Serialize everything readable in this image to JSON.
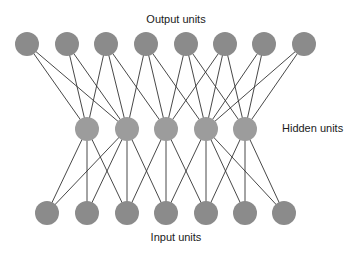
{
  "labels": {
    "output": "Output units",
    "hidden": "Hidden units",
    "input": "Input units"
  },
  "colors": {
    "background": "#ffffff",
    "edge": "#333333",
    "output_node": "#8b8b8b",
    "hidden_node": "#9c9c9c",
    "input_node": "#8b8b8b",
    "text": "#1a1a1a"
  },
  "node_radius": 12,
  "layers": {
    "output": {
      "y": 44,
      "x": [
        27,
        67,
        106,
        146,
        186,
        225,
        264,
        304
      ]
    },
    "hidden": {
      "y": 129,
      "x": [
        87,
        127,
        166,
        206,
        245
      ]
    },
    "input": {
      "y": 213,
      "x": [
        47,
        87,
        127,
        166,
        206,
        245,
        284
      ]
    }
  },
  "edges": {
    "output_to_hidden": [
      [
        0,
        0
      ],
      [
        0,
        1
      ],
      [
        1,
        0
      ],
      [
        1,
        1
      ],
      [
        2,
        0
      ],
      [
        2,
        1
      ],
      [
        2,
        2
      ],
      [
        3,
        1
      ],
      [
        3,
        2
      ],
      [
        3,
        3
      ],
      [
        4,
        2
      ],
      [
        4,
        3
      ],
      [
        4,
        4
      ],
      [
        5,
        2
      ],
      [
        5,
        3
      ],
      [
        5,
        4
      ],
      [
        6,
        3
      ],
      [
        6,
        4
      ],
      [
        7,
        3
      ],
      [
        7,
        4
      ]
    ],
    "hidden_to_input": [
      [
        0,
        0
      ],
      [
        0,
        1
      ],
      [
        0,
        2
      ],
      [
        1,
        0
      ],
      [
        1,
        1
      ],
      [
        1,
        2
      ],
      [
        1,
        3
      ],
      [
        2,
        2
      ],
      [
        2,
        3
      ],
      [
        2,
        4
      ],
      [
        3,
        3
      ],
      [
        3,
        4
      ],
      [
        3,
        5
      ],
      [
        3,
        6
      ],
      [
        4,
        4
      ],
      [
        4,
        5
      ],
      [
        4,
        6
      ]
    ]
  }
}
